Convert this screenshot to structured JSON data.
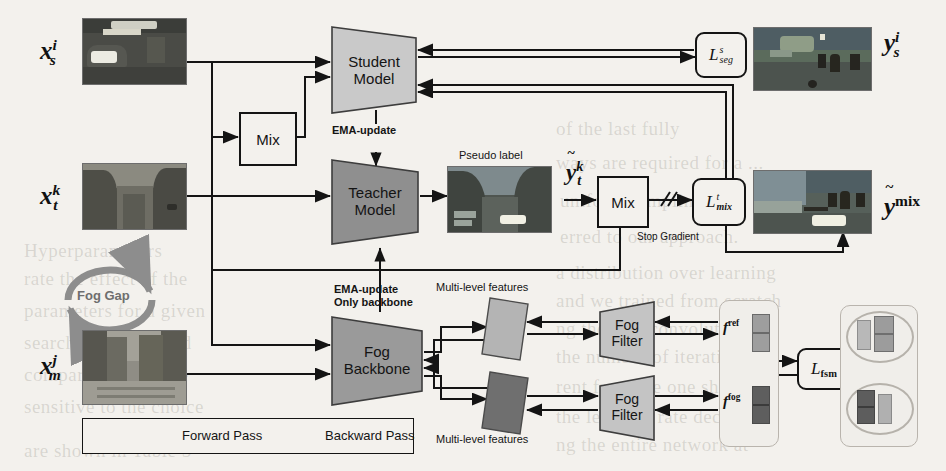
{
  "figure": {
    "type": "architecture-diagram",
    "background_color": "#f3f1ed",
    "line_color": "#141414"
  },
  "inputs": [
    {
      "name": "source-image",
      "label_base": "x",
      "label_sub": "s",
      "label_sup": "i",
      "caption": "source domain image thumbnail"
    },
    {
      "name": "target-image",
      "label_base": "x",
      "label_sub": "t",
      "label_sup": "k",
      "caption": "target domain foggy image thumbnail"
    },
    {
      "name": "mapped-image",
      "label_base": "x",
      "label_sub": "m",
      "label_sup": "j",
      "caption": "real foggy street image thumbnail"
    }
  ],
  "outputs": [
    {
      "name": "source-label",
      "label_base": "y",
      "label_sub": "s",
      "label_sup": "i",
      "tilde": false
    },
    {
      "name": "mixed-label",
      "label_base": "y",
      "label_sup": "mix",
      "tilde": true
    },
    {
      "name": "pseudo-label",
      "label_base": "y",
      "label_sub": "t",
      "label_sup": "k",
      "tilde": true
    }
  ],
  "models": {
    "student": {
      "line1": "Student",
      "line2": "Model",
      "fill": "#c9c9c9"
    },
    "teacher": {
      "line1": "Teacher",
      "line2": "Model",
      "fill": "#8f8f8f"
    },
    "fog_backbone": {
      "line1": "Fog",
      "line2": "Backbone",
      "fill": "#9a9a9a"
    },
    "fog_filter_top": {
      "line1": "Fog",
      "line2": "Filter",
      "fill": "#c4c4c4"
    },
    "fog_filter_bottom": {
      "line1": "Fog",
      "line2": "Filter",
      "fill": "#c4c4c4"
    }
  },
  "boxes": {
    "mix_left": "Mix",
    "mix_right": "Mix"
  },
  "losses": {
    "seg": {
      "base": "L",
      "sup": "s",
      "sub": "seg"
    },
    "mix": {
      "base": "L",
      "sup": "t",
      "sub": "mix"
    },
    "fsm": {
      "base": "L",
      "sub": "fsm"
    }
  },
  "annotations": {
    "ema_update_student": "EMA-update",
    "ema_update_backbone_line1": "EMA-update",
    "ema_update_backbone_line2": "Only backbone",
    "pseudo_label": "Pseudo label",
    "stop_gradient": "Stop Gradient",
    "fog_gap": "Fog Gap",
    "multi_level_features_top": "Multi-level features",
    "multi_level_features_bottom": "Multi-level features"
  },
  "feature_vectors": {
    "ref": {
      "base": "f",
      "sup": "ref"
    },
    "fog": {
      "base": "f",
      "sup": "fog"
    }
  },
  "legend": {
    "forward": "Forward Pass",
    "backward": "Backward Pass"
  },
  "ghost_text": [
    {
      "text": "of the last fully",
      "x": 556,
      "y": 118
    },
    {
      "text": "ways  are  required  for  a  ...",
      "x": 556,
      "y": 152
    },
    {
      "text": "uniform  sampling",
      "x": 560,
      "y": 190
    },
    {
      "text": "erred  to  our  approach.",
      "x": 560,
      "y": 226
    },
    {
      "text": "a  distribution  over  learning",
      "x": 556,
      "y": 262
    },
    {
      "text": "and  we  trained  from  scratch",
      "x": 556,
      "y": 290
    },
    {
      "text": "ng  the  first  convolutional",
      "x": 556,
      "y": 318
    },
    {
      "text": "the  number  of  iterations",
      "x": 556,
      "y": 346
    },
    {
      "text": "rent  from  the  one  shown",
      "x": 556,
      "y": 376
    },
    {
      "text": "the  learning  rate  decay",
      "x": 556,
      "y": 406
    },
    {
      "text": "ng  the  entire  network  at",
      "x": 556,
      "y": 434
    },
    {
      "text": "rate  the  effect  of  the",
      "x": 24,
      "y": 268
    },
    {
      "text": "parameters  for  a  given",
      "x": 24,
      "y": 300
    },
    {
      "text": "search  strategies  and",
      "x": 24,
      "y": 332
    },
    {
      "text": "comparison  with  the",
      "x": 24,
      "y": 364
    },
    {
      "text": "sensitive  to  the  choice",
      "x": 24,
      "y": 396
    },
    {
      "text": "are  shown  in  Table  5",
      "x": 24,
      "y": 440
    },
    {
      "text": "Hyperparameters",
      "x": 24,
      "y": 240
    }
  ]
}
